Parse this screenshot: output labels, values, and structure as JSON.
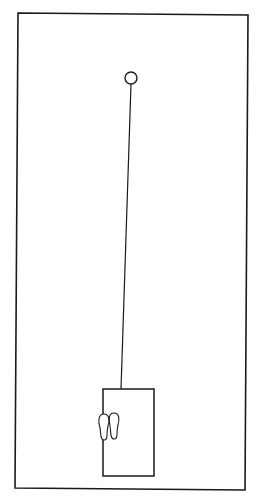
{
  "diagram": {
    "colors": {
      "background": "#ffffff",
      "stroke": "#1a1a1a"
    },
    "outer_frame": {
      "x1": 18,
      "y1": 13,
      "x2": 248,
      "y2": 15,
      "x3": 245,
      "y3": 490,
      "x4": 15,
      "y4": 488
    },
    "circle": {
      "cx": 131,
      "cy": 78,
      "r": 6
    },
    "line": {
      "x1": 131,
      "y1": 84,
      "x2": 121,
      "y2": 389
    },
    "inner_rect": {
      "x": 103,
      "y": 389,
      "width": 51,
      "height": 87
    },
    "footprints": {
      "icon": "footprints-icon",
      "x": 98,
      "y": 412
    }
  }
}
